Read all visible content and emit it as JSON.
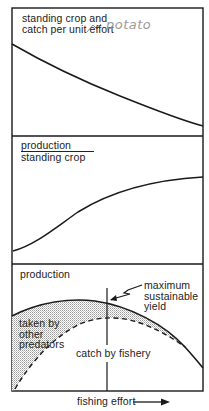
{
  "panels": {
    "top": {
      "label_line1": "standing crop and",
      "label_line2": "catch per unit effort"
    },
    "middle": {
      "label_numerator": "production",
      "label_denominator": "standing crop"
    },
    "bottom": {
      "label": "production",
      "annotation_msy_line1": "maximum",
      "annotation_msy_line2": "sustainable",
      "annotation_msy_line3": "yield",
      "region_predators_line1": "taken by",
      "region_predators_line2": "other",
      "region_predators_line3": "predators",
      "region_fishery": "catch by fishery"
    }
  },
  "x_axis": {
    "label": "fishing effort",
    "arrow": "right-arrow"
  },
  "handwritten_note": "potato",
  "colors": {
    "line": "#1a1a1a",
    "shading": "#c8c8c8",
    "handwriting": "#9a9a9a",
    "background": "#ffffff"
  }
}
